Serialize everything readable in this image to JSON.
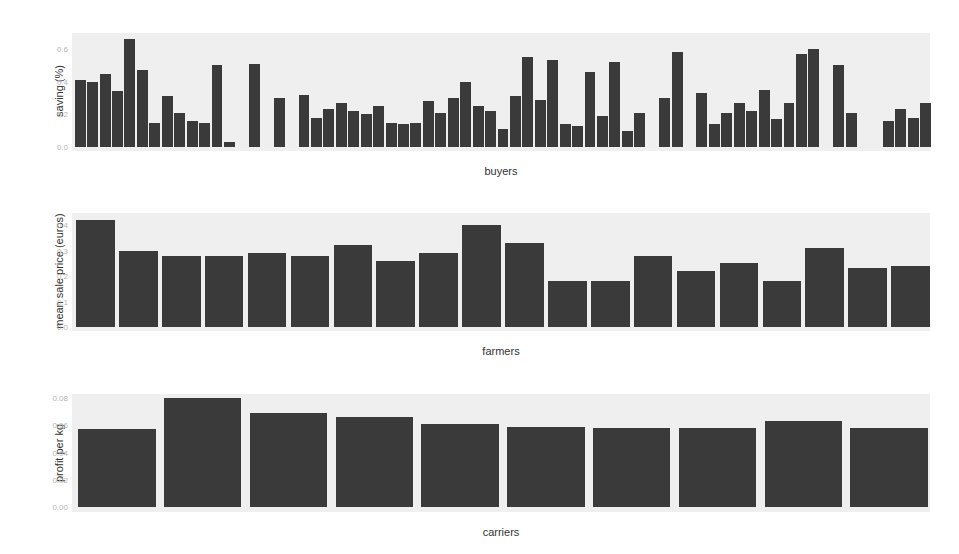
{
  "chart_data": [
    {
      "type": "bar",
      "title": "",
      "xlabel": "buyers",
      "ylabel": "saving (%)",
      "yticks": [
        "0.0",
        "0.2",
        "0.4",
        "0.6"
      ],
      "ylim": [
        0,
        0.7
      ],
      "grid": true,
      "categories_count": 69,
      "values": [
        0.41,
        0.4,
        0.45,
        0.34,
        0.66,
        0.47,
        0.15,
        0.31,
        0.21,
        0.16,
        0.15,
        0.5,
        0.03,
        0,
        0.51,
        0,
        0.3,
        0,
        0.32,
        0.18,
        0.23,
        0.27,
        0.22,
        0.2,
        0.25,
        0.15,
        0.14,
        0.15,
        0.28,
        0.21,
        0.3,
        0.4,
        0.25,
        0.22,
        0.11,
        0.31,
        0.55,
        0.29,
        0.53,
        0.14,
        0.13,
        0.46,
        0.19,
        0.52,
        0.1,
        0.21,
        0,
        0.3,
        0.58,
        0,
        0.33,
        0.14,
        0.21,
        0.27,
        0.22,
        0.35,
        0.17,
        0.27,
        0.57,
        0.6,
        0,
        0.5,
        0.21,
        0,
        0,
        0.16,
        0.23,
        0.18,
        0.27
      ]
    },
    {
      "type": "bar",
      "title": "",
      "xlabel": "farmers",
      "ylabel": "mean sale price (euros)",
      "yticks": [
        "0.0",
        "0.1",
        "0.2",
        "0.3",
        "0.4"
      ],
      "ylim": [
        0,
        0.44
      ],
      "grid": true,
      "categories_count": 20,
      "values": [
        0.42,
        0.3,
        0.28,
        0.28,
        0.29,
        0.28,
        0.32,
        0.26,
        0.29,
        0.4,
        0.33,
        0.18,
        0.18,
        0.28,
        0.22,
        0.25,
        0.18,
        0.31,
        0.23,
        0.24
      ]
    },
    {
      "type": "bar",
      "title": "",
      "xlabel": "carriers",
      "ylabel": "profit per kg",
      "yticks": [
        "0.00",
        "0.02",
        "0.04",
        "0.06",
        "0.08"
      ],
      "ylim": [
        0,
        0.086
      ],
      "grid": true,
      "categories_count": 10,
      "values": [
        0.057,
        0.08,
        0.069,
        0.066,
        0.061,
        0.059,
        0.058,
        0.058,
        0.063,
        0.058
      ]
    }
  ],
  "colors": {
    "bar": "#3a3a3a",
    "panel_bg": "#efefef",
    "tick_text": "#b5b5b5",
    "label_text": "#333333"
  }
}
